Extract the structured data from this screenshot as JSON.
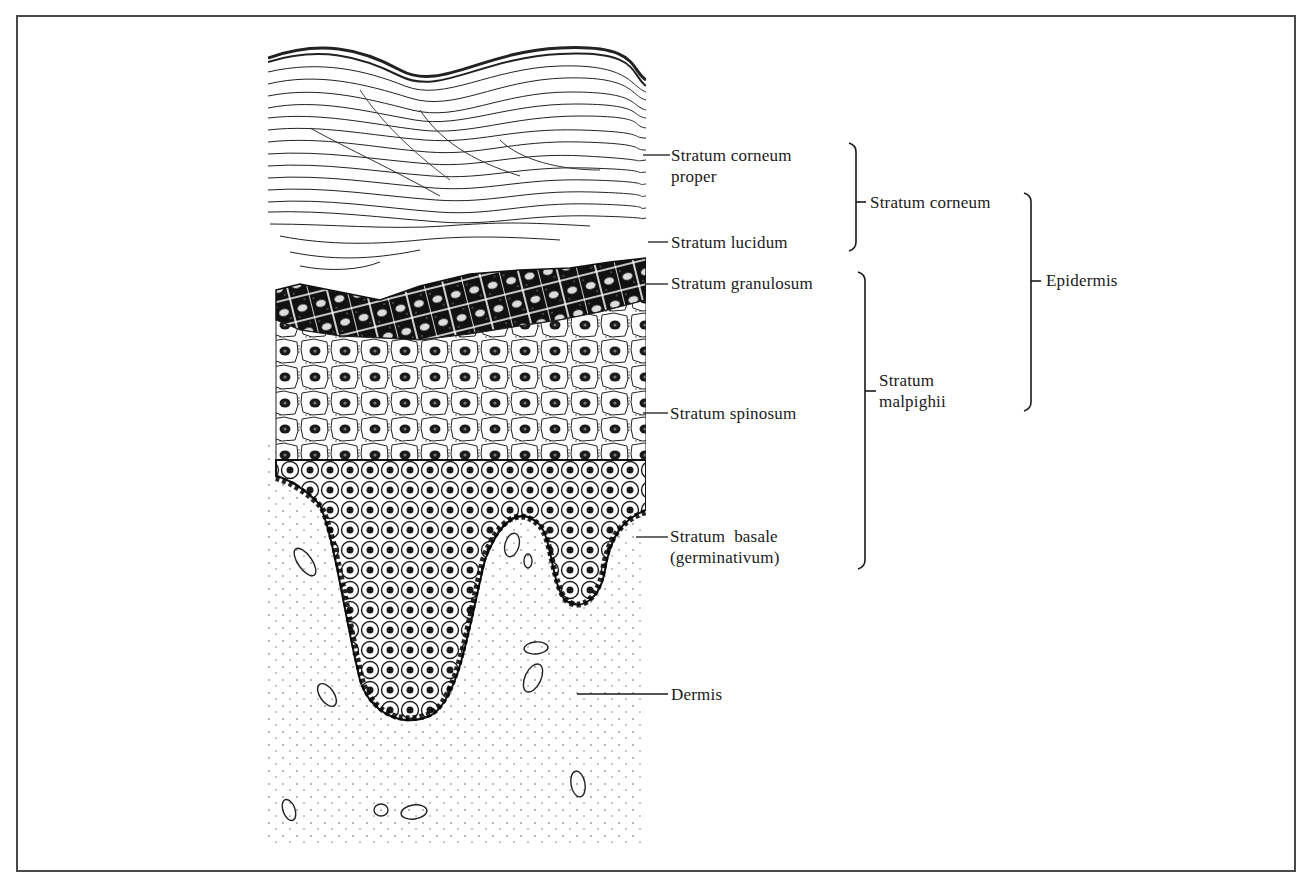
{
  "figure": {
    "colors": {
      "ink": "#1a1a1a",
      "frame": "#4a4a4a",
      "background": "#ffffff"
    }
  },
  "labels": {
    "corneum_proper_line1": "Stratum corneum",
    "corneum_proper_line2": "proper",
    "lucidum": "Stratum lucidum",
    "granulosum": "Stratum granulosum",
    "spinosum": "Stratum spinosum",
    "basale_line1": "Stratum  basale",
    "basale_line2": "(germinativum)",
    "dermis": "Dermis"
  },
  "groups": {
    "corneum": "Stratum corneum",
    "malpighii_line1": "Stratum",
    "malpighii_line2": "malpighii",
    "epidermis": "Epidermis"
  },
  "structure": {
    "epidermis": {
      "stratum_corneum": [
        "Stratum corneum proper",
        "Stratum lucidum"
      ],
      "stratum_malpighii": [
        "Stratum granulosum",
        "Stratum spinosum",
        "Stratum basale (germinativum)"
      ]
    },
    "dermis": "Dermis"
  }
}
